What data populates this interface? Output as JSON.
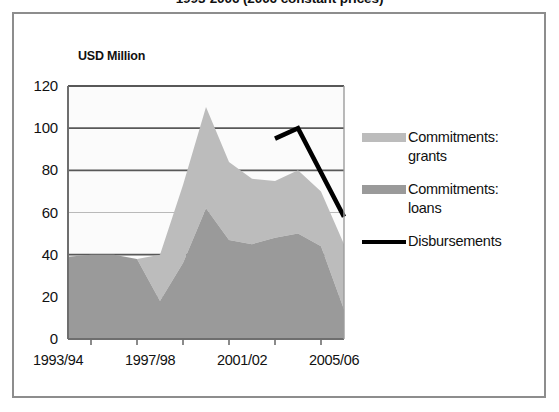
{
  "chart_data": {
    "type": "area",
    "title": "1993-2006 (2006 constant prices)",
    "ylabel": "USD Million",
    "xlabel": "",
    "ylim": [
      0,
      120
    ],
    "yticks": [
      0,
      20,
      40,
      60,
      80,
      100,
      120
    ],
    "ytick_labels": [
      "0",
      "20",
      "40",
      "60",
      "80",
      "100",
      "120"
    ],
    "grid": true,
    "legend_position": "right",
    "x": [
      "1993/94",
      "1994/95",
      "1995/96",
      "1996/97",
      "1997/98",
      "1998/99",
      "1999/00",
      "2000/01",
      "2001/02",
      "2002/03",
      "2003/04",
      "2004/05",
      "2005/06"
    ],
    "xtick_labels": [
      "1993/94",
      "1997/98",
      "2001/02",
      "2005/06"
    ],
    "xtick_indices": [
      0,
      4,
      8,
      12
    ],
    "stacked": true,
    "series": [
      {
        "name": "Commitments: loans",
        "type": "area",
        "color": "#9a9a9a",
        "values": [
          39,
          40,
          40,
          38,
          18,
          36,
          62,
          47,
          45,
          48,
          50,
          44,
          14
        ]
      },
      {
        "name": "Commitments: grants",
        "type": "area",
        "color": "#bcbcbc",
        "values": [
          0,
          0,
          0,
          0,
          22,
          37,
          48,
          37,
          31,
          27,
          30,
          26,
          31
        ]
      },
      {
        "name": "Disbursements",
        "type": "line",
        "color": "#000000",
        "x_start_index": 9,
        "values": [
          null,
          null,
          null,
          null,
          null,
          null,
          null,
          null,
          null,
          95,
          100,
          79,
          58
        ]
      }
    ],
    "stack_totals": [
      39,
      40,
      40,
      38,
      40,
      73,
      110,
      84,
      76,
      75,
      80,
      70,
      45
    ]
  },
  "legend": {
    "items": [
      {
        "label_line1": "Commitments:",
        "label_line2": "grants",
        "swatch": "grants-swatch"
      },
      {
        "label_line1": "Commitments:",
        "label_line2": "loans",
        "swatch": "loans-swatch"
      },
      {
        "label_line1": "Disbursements",
        "label_line2": "",
        "swatch": "disbursements-line-swatch"
      }
    ]
  }
}
